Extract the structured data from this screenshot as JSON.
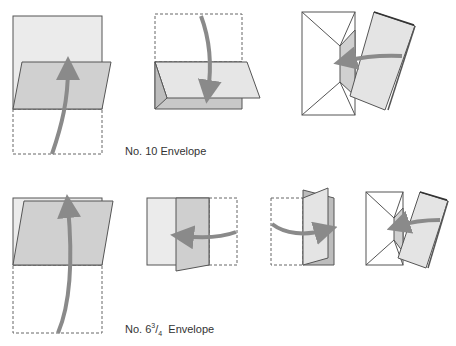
{
  "diagram": {
    "colors": {
      "paper_light": "#ebebeb",
      "paper_mid": "#d4d4d4",
      "paper_dark": "#c2c2c2",
      "outline": "#555555",
      "arrow": "#8a8a8a",
      "dashed": "#666666",
      "envelope": "#ffffff"
    },
    "sections": [
      {
        "id": "no10",
        "caption": "No. 10 Envelope",
        "steps": [
          {
            "step": 1,
            "action": "fold-bottom-third-up",
            "arrow_direction": "up"
          },
          {
            "step": 2,
            "action": "fold-top-third-down",
            "arrow_direction": "down"
          },
          {
            "step": 3,
            "action": "insert-into-envelope",
            "arrow_direction": "left"
          }
        ]
      },
      {
        "id": "no6-3-4",
        "caption_prefix": "No. 6",
        "caption_fraction_num": "3",
        "caption_fraction_den": "4",
        "caption_suffix": "Envelope",
        "steps": [
          {
            "step": 1,
            "action": "fold-bottom-half-up",
            "arrow_direction": "up"
          },
          {
            "step": 2,
            "action": "fold-right-third-left",
            "arrow_direction": "left"
          },
          {
            "step": 3,
            "action": "fold-left-third-right",
            "arrow_direction": "right"
          },
          {
            "step": 4,
            "action": "insert-into-envelope",
            "arrow_direction": "left"
          }
        ]
      }
    ]
  }
}
